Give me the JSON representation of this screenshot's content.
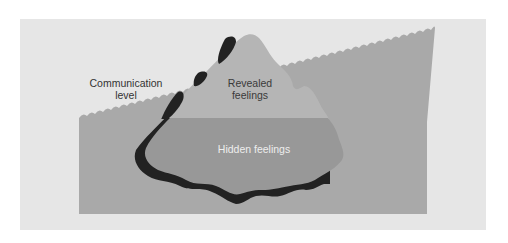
{
  "diagram": {
    "type": "iceberg-metaphor",
    "labels": {
      "communication_level": "Communication\nlevel",
      "revealed_feelings": "Revealed\nfeelings",
      "hidden_feelings": "Hidden feelings"
    },
    "colors": {
      "page_background": "#ffffff",
      "panel_background": "#e6e6e6",
      "water": "#a9a9a9",
      "wave_crest": "#dcdcdc",
      "iceberg_above_water": "#b5b5b5",
      "iceberg_below_water": "#989898",
      "iceberg_shadow": "#222222",
      "text_dark": "#333333",
      "text_light": "#eeeeee"
    }
  }
}
